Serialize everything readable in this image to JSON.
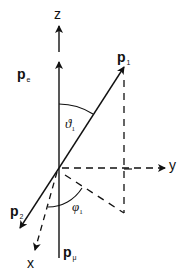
{
  "diagram": {
    "type": "3d-coordinate-vector-diagram",
    "colors": {
      "ink": "#111111",
      "background": "#ffffff"
    },
    "axes": {
      "z": {
        "label": "z"
      },
      "y": {
        "label": "y"
      },
      "x": {
        "label": "x"
      }
    },
    "vectors": {
      "p_e": {
        "symbol": "p",
        "subscript": "e"
      },
      "p_1": {
        "symbol": "p",
        "subscript": "1"
      },
      "p_2": {
        "symbol": "p",
        "subscript": "2"
      },
      "p_mu": {
        "symbol": "p",
        "subscript": "μ"
      }
    },
    "angles": {
      "theta_1": {
        "symbol": "ϑ",
        "subscript": "1"
      },
      "phi_1": {
        "symbol": "φ",
        "subscript": "1"
      }
    }
  }
}
